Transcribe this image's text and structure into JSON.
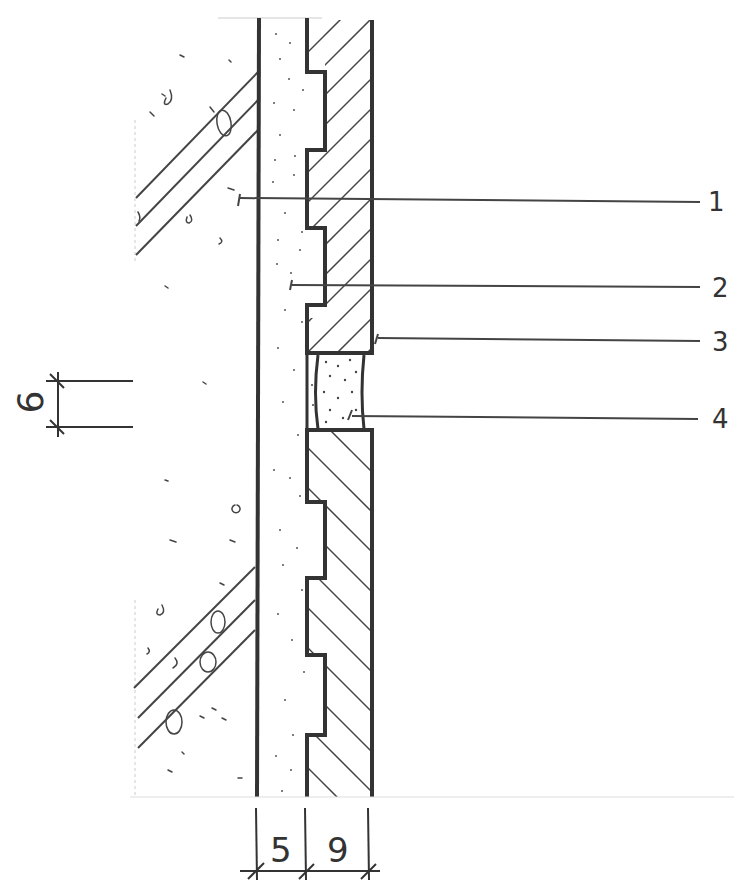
{
  "drawing": {
    "type": "construction-section-detail",
    "style": "hand-drawn",
    "stroke_color": "#3a3a3a",
    "callouts": [
      {
        "id": "1",
        "label": "1",
        "y": 200
      },
      {
        "id": "2",
        "label": "2",
        "y": 287
      },
      {
        "id": "3",
        "label": "3",
        "y": 340
      },
      {
        "id": "4",
        "label": "4",
        "y": 418
      }
    ],
    "dimensions": {
      "vertical_joint": "6",
      "bottom_left": "5",
      "bottom_right": "9"
    },
    "layers": [
      {
        "name": "concrete-base",
        "hatch": "aggregate-with-rebar"
      },
      {
        "name": "mortar-bed",
        "hatch": "stipple",
        "thickness": "5"
      },
      {
        "name": "facing-tile",
        "hatch": "diagonal",
        "thickness": "9"
      },
      {
        "name": "joint-filler",
        "hatch": "dense-stipple",
        "width": "6"
      }
    ]
  }
}
